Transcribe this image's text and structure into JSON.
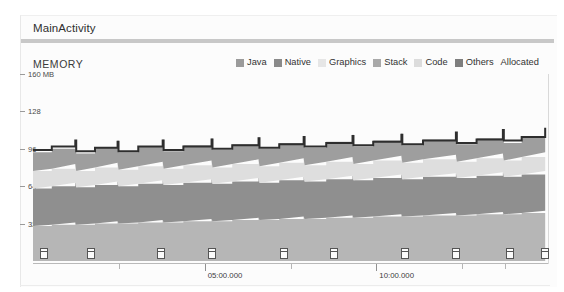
{
  "window": {
    "background": "#ffffff",
    "panel_background": "#fcfcfc"
  },
  "activity": {
    "label": "MainActivity",
    "bar_color": "#c8c8c8"
  },
  "section": {
    "title": "MEMORY"
  },
  "legend": {
    "items": [
      {
        "label": "Java",
        "swatch": "#9b9b9b",
        "has_swatch": true
      },
      {
        "label": "Native",
        "swatch": "#8a8a8a",
        "has_swatch": true
      },
      {
        "label": "Graphics",
        "swatch": "#e6e6e6",
        "has_swatch": true
      },
      {
        "label": "Stack",
        "swatch": "#a9a9a9",
        "has_swatch": true
      },
      {
        "label": "Code",
        "swatch": "#dcdcdc",
        "has_swatch": true
      },
      {
        "label": "Others",
        "swatch": "#7e7e7e",
        "has_swatch": true
      },
      {
        "label": "Allocated",
        "swatch": "#3a3a3a",
        "has_swatch": false
      }
    ]
  },
  "chart_data": {
    "type": "area",
    "title": "MEMORY",
    "xlabel": "",
    "ylabel": "MB",
    "ylim": [
      0,
      160
    ],
    "xlim": [
      0,
      900
    ],
    "grid": false,
    "legend_position": "top-right",
    "y_ticks": [
      {
        "value": 160,
        "label": "160 MB"
      },
      {
        "value": 128,
        "label": "128"
      },
      {
        "value": 96,
        "label": "96"
      },
      {
        "value": 64,
        "label": "64"
      },
      {
        "value": 32,
        "label": "32"
      }
    ],
    "x_ticks": [
      {
        "value": 150,
        "label": "",
        "major": false
      },
      {
        "value": 300,
        "label": "05:00.000",
        "major": true
      },
      {
        "value": 450,
        "label": "",
        "major": false
      },
      {
        "value": 600,
        "label": "10:00.000",
        "major": true
      },
      {
        "value": 750,
        "label": "",
        "major": false
      },
      {
        "value": 825,
        "label": "",
        "major": false
      }
    ],
    "x_tick_labels": [
      "05:00.000",
      "10:00.000"
    ],
    "sawtooth_description": "Stacked memory usage rising steadily and dropping at each garbage-collection event, producing a sawtooth envelope.",
    "x": [
      0,
      20,
      45,
      46,
      66,
      90,
      91,
      112,
      138,
      139,
      160,
      190,
      191,
      212,
      240,
      241,
      262,
      288,
      289,
      312,
      340,
      341,
      362,
      392,
      393,
      415,
      450,
      451,
      472,
      500,
      501,
      520,
      545
    ],
    "series": [
      {
        "name": "Others",
        "color": "#b6b6b6",
        "values": [
          30,
          31,
          33,
          31,
          32,
          34,
          32,
          33,
          35,
          33,
          34,
          36,
          34,
          35,
          37,
          35,
          36,
          38,
          36,
          37,
          39,
          37,
          38,
          40,
          38,
          39,
          41,
          39,
          40,
          42,
          40,
          41,
          43
        ]
      },
      {
        "name": "Code",
        "color": "#8f8f8f",
        "values": [
          32,
          33,
          34,
          32,
          33,
          34,
          32,
          33,
          34,
          32,
          33,
          34,
          32,
          33,
          34,
          32,
          33,
          34,
          32,
          33,
          34,
          32,
          33,
          34,
          32,
          33,
          34,
          32,
          33,
          34,
          32,
          33,
          34
        ]
      },
      {
        "name": "Graphics",
        "color": "#dedede",
        "values": [
          15,
          15,
          16,
          14,
          15,
          16,
          14,
          15,
          16,
          14,
          15,
          16,
          14,
          15,
          16,
          14,
          15,
          16,
          14,
          15,
          16,
          14,
          15,
          16,
          14,
          15,
          16,
          14,
          15,
          16,
          14,
          15,
          16
        ]
      },
      {
        "name": "Java",
        "color": "#9e9e9e",
        "values": [
          16,
          17,
          19,
          15,
          17,
          19,
          15,
          17,
          19,
          15,
          17,
          19,
          15,
          17,
          19,
          15,
          17,
          19,
          15,
          17,
          19,
          15,
          17,
          19,
          15,
          17,
          19,
          15,
          17,
          19,
          15,
          17,
          19
        ]
      }
    ],
    "allocated_line": {
      "name": "Allocated",
      "color": "#2e2e2e",
      "values": [
        95,
        98,
        103,
        94,
        97,
        102,
        94,
        98,
        103,
        95,
        98,
        104,
        96,
        99,
        105,
        97,
        100,
        106,
        98,
        101,
        107,
        99,
        102,
        108,
        100,
        103,
        110,
        101,
        104,
        112,
        103,
        106,
        114
      ]
    },
    "gc_events": [
      {
        "label": "gc-event",
        "x": 12
      },
      {
        "label": "gc-event",
        "x": 62
      },
      {
        "label": "gc-event",
        "x": 136
      },
      {
        "label": "gc-event",
        "x": 190
      },
      {
        "label": "gc-event",
        "x": 267
      },
      {
        "label": "gc-event",
        "x": 320
      },
      {
        "label": "gc-event",
        "x": 396
      },
      {
        "label": "gc-event",
        "x": 450
      },
      {
        "label": "gc-event",
        "x": 508
      },
      {
        "label": "gc-event",
        "x": 545
      }
    ]
  }
}
